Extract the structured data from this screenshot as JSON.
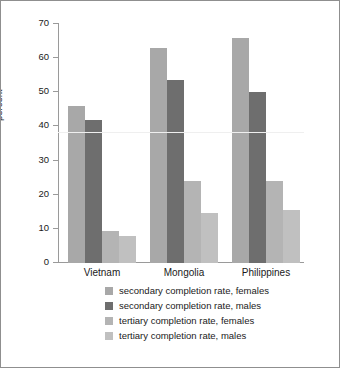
{
  "chart_data": {
    "type": "bar",
    "title": "",
    "xlabel": "",
    "ylabel": "percent",
    "ylim": [
      0,
      70
    ],
    "y_ticks": [
      0,
      10,
      20,
      30,
      40,
      50,
      60,
      70
    ],
    "grid": false,
    "legend_position": "bottom",
    "categories": [
      "Vietnam",
      "Mongolia",
      "Philippines"
    ],
    "series": [
      {
        "name": "secondary completion rate, females",
        "color": "#a8a8a8",
        "values": [
          46,
          63,
          66
        ]
      },
      {
        "name": "secondary completion rate, males",
        "color": "#6e6e6e",
        "values": [
          42,
          53.5,
          50
        ]
      },
      {
        "name": "tertiary completion rate, females",
        "color": "#b4b4b4",
        "values": [
          9.4,
          24,
          24
        ]
      },
      {
        "name": "tertiary completion rate, males",
        "color": "#c0c0c0",
        "values": [
          8,
          14.7,
          15.5
        ]
      }
    ]
  },
  "axis": {
    "y_title": "percent",
    "y_tick_labels": [
      "0",
      "10",
      "20",
      "30",
      "40",
      "50",
      "60",
      "70"
    ],
    "x_tick_labels": [
      "Vietnam",
      "Mongolia",
      "Philippines"
    ]
  },
  "legend": {
    "items": [
      {
        "label": "secondary completion rate, females",
        "color": "#a8a8a8"
      },
      {
        "label": "secondary completion rate, males",
        "color": "#6e6e6e"
      },
      {
        "label": "tertiary completion rate, females",
        "color": "#b4b4b4"
      },
      {
        "label": "tertiary completion rate, males",
        "color": "#c0c0c0"
      }
    ]
  },
  "style": {
    "background": "#ffffff",
    "border_color": "#8f8f8f",
    "axis_color": "#9a9a9a",
    "text_color": "#1a1a1a"
  }
}
